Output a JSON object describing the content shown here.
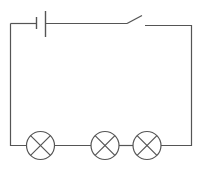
{
  "diagram": {
    "type": "series-circuit",
    "stroke_color": "#555555",
    "background": "#ffffff",
    "components": {
      "battery": {
        "label": "cell",
        "count": 1
      },
      "switch": {
        "label": "switch",
        "state": "open"
      },
      "lamps": [
        {
          "id": "lamp-1",
          "cx": 40.5,
          "cy": 145
        },
        {
          "id": "lamp-2",
          "cx": 105,
          "cy": 145
        },
        {
          "id": "lamp-3",
          "cx": 147,
          "cy": 145
        }
      ]
    },
    "lamp_radius": 14
  }
}
